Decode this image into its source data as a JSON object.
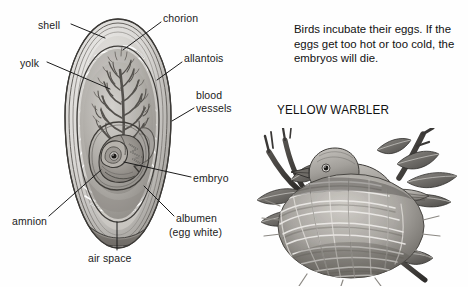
{
  "page": {
    "background_color": "#fefefe",
    "width": 468,
    "height": 287,
    "ink_color": "#1b1b1b"
  },
  "egg_diagram": {
    "title": "egg cross-section",
    "labels": [
      {
        "id": "shell",
        "text": "shell",
        "x": 38,
        "y": 19
      },
      {
        "id": "chorion",
        "text": "chorion",
        "x": 163,
        "y": 12
      },
      {
        "id": "allantois",
        "text": "allantois",
        "x": 184,
        "y": 52
      },
      {
        "id": "yolk",
        "text": "yolk",
        "x": 20,
        "y": 57
      },
      {
        "id": "blood",
        "text": "blood",
        "x": 196,
        "y": 89
      },
      {
        "id": "vessels",
        "text": "vessels",
        "x": 196,
        "y": 102
      },
      {
        "id": "embryo",
        "text": "embryo",
        "x": 193,
        "y": 172
      },
      {
        "id": "amnion",
        "text": "amnion",
        "x": 12,
        "y": 215
      },
      {
        "id": "albumen",
        "text": "albumen",
        "x": 176,
        "y": 212
      },
      {
        "id": "egg-white",
        "text": "(egg white)",
        "x": 169,
        "y": 226
      },
      {
        "id": "air-space",
        "text": "air space",
        "x": 88,
        "y": 252
      }
    ],
    "parts": [
      "shell",
      "chorion",
      "allantois",
      "yolk",
      "blood vessels",
      "embryo",
      "amnion",
      "albumen (egg white)",
      "air space"
    ]
  },
  "right_panel": {
    "body_text": "Birds incubate their eggs. If the eggs get too hot or too cold, the embryos will die.",
    "species_caption": "YELLOW WARBLER",
    "illustration_name": "yellow warbler on nest"
  }
}
